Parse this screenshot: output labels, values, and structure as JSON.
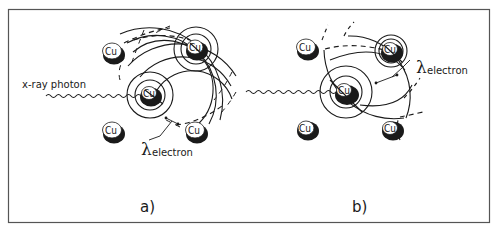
{
  "figure": {
    "frame_color": "#555555",
    "ink_color": "#1a1a1a",
    "background": "#ffffff"
  },
  "panel_a": {
    "label": "a)",
    "photon_label": "x-ray photon",
    "lambda_symbol": "λ",
    "lambda_subscript": "electron",
    "atoms": [
      {
        "label": "Cu",
        "position": "top-left"
      },
      {
        "label": "Cu",
        "position": "top-right"
      },
      {
        "label": "Cu",
        "position": "center"
      },
      {
        "label": "Cu",
        "position": "bottom-left"
      },
      {
        "label": "Cu",
        "position": "bottom-right"
      }
    ]
  },
  "panel_b": {
    "label": "b)",
    "lambda_symbol": "λ",
    "lambda_subscript": "electron",
    "atoms": [
      {
        "label": "Cu",
        "position": "top-left"
      },
      {
        "label": "Cu",
        "position": "top-right"
      },
      {
        "label": "Cu",
        "position": "center"
      },
      {
        "label": "Cu",
        "position": "bottom-left"
      },
      {
        "label": "Cu",
        "position": "bottom-right"
      }
    ]
  }
}
